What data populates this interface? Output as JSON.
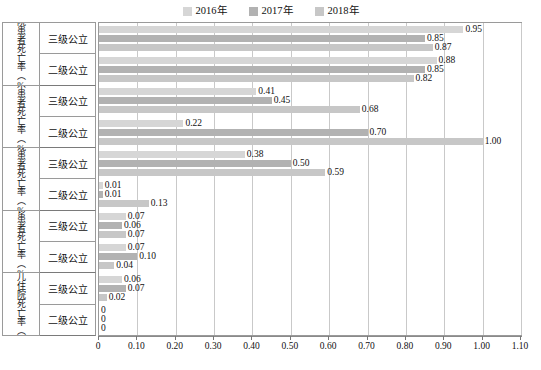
{
  "chart_data": {
    "type": "bar",
    "orientation": "horizontal",
    "title": "",
    "xlabel": "",
    "ylabel": "",
    "xlim": [
      0,
      1.1
    ],
    "xticks": [
      "0",
      "0.10",
      "0.20",
      "0.30",
      "0.40",
      "0.50",
      "0.60",
      "0.70",
      "0.80",
      "0.90",
      "1.00",
      "1.10"
    ],
    "xtick_values": [
      0,
      0.1,
      0.2,
      0.3,
      0.4,
      0.5,
      0.6,
      0.7,
      0.8,
      0.9,
      1.0,
      1.1
    ],
    "grid": true,
    "legend_position": "top-center",
    "legend": [
      "2016年",
      "2017年",
      "2018年"
    ],
    "series_colors": [
      "#d6d6d6",
      "#b2b2b2",
      "#c7c7c7"
    ],
    "groups": [
      {
        "label": "住院患者死亡率（%）",
        "subgroups": [
          {
            "label": "三级公立",
            "values": [
              0.95,
              0.85,
              0.87
            ],
            "labels": [
              "0.95",
              "0.85",
              "0.87"
            ]
          },
          {
            "label": "二级公立",
            "values": [
              0.88,
              0.85,
              0.82
            ],
            "labels": [
              "0.88",
              "0.85",
              "0.82"
            ]
          }
        ]
      },
      {
        "label": "手术患者死亡率（%）",
        "subgroups": [
          {
            "label": "三级公立",
            "values": [
              0.41,
              0.45,
              0.68
            ],
            "labels": [
              "0.41",
              "0.45",
              "0.68"
            ]
          },
          {
            "label": "二级公立",
            "values": [
              0.22,
              0.7,
              1.0
            ],
            "labels": [
              "0.22",
              "0.70",
              "1.00"
            ]
          }
        ]
      },
      {
        "label": "留观患者死亡率（%）",
        "subgroups": [
          {
            "label": "三级公立",
            "values": [
              0.38,
              0.5,
              0.59
            ],
            "labels": [
              "0.38",
              "0.50",
              "0.59"
            ]
          },
          {
            "label": "二级公立",
            "values": [
              0.01,
              0.01,
              0.13
            ],
            "labels": [
              "0.01",
              "0.01",
              "0.13"
            ]
          }
        ]
      },
      {
        "label": "急诊患者死亡率（%）",
        "subgroups": [
          {
            "label": "三级公立",
            "values": [
              0.07,
              0.06,
              0.07
            ],
            "labels": [
              "0.07",
              "0.06",
              "0.07"
            ]
          },
          {
            "label": "二级公立",
            "values": [
              0.07,
              0.1,
              0.04
            ],
            "labels": [
              "0.07",
              "0.10",
              "0.04"
            ]
          }
        ]
      },
      {
        "label": "新生儿住院死亡率（%）",
        "subgroups": [
          {
            "label": "三级公立",
            "values": [
              0.06,
              0.07,
              0.02
            ],
            "labels": [
              "0.06",
              "0.07",
              "0.02"
            ]
          },
          {
            "label": "二级公立",
            "values": [
              0,
              0,
              0
            ],
            "labels": [
              "0",
              "0",
              "0"
            ]
          }
        ]
      }
    ]
  }
}
